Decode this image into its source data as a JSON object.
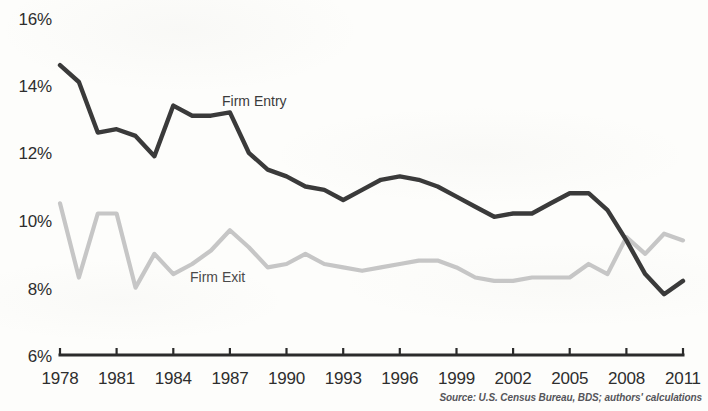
{
  "chart_data": {
    "type": "line",
    "title": "",
    "subtitle": "",
    "xlabel": "",
    "ylabel": "",
    "xlim": [
      1978,
      2011
    ],
    "ylim": [
      6,
      16
    ],
    "y_tick_labels": [
      "16%",
      "14%",
      "12%",
      "10%",
      "8%",
      "6%"
    ],
    "y_tick_values": [
      16,
      14,
      12,
      10,
      8,
      6
    ],
    "x_tick_labels": [
      "1978",
      "1981",
      "1984",
      "1987",
      "1990",
      "1993",
      "1996",
      "1999",
      "2002",
      "2005",
      "2008",
      "2011"
    ],
    "x_tick_values": [
      1978,
      1981,
      1984,
      1987,
      1990,
      1993,
      1996,
      1999,
      2002,
      2005,
      2008,
      2011
    ],
    "grid": false,
    "legend_position": "inline-labels",
    "x": [
      1978,
      1979,
      1980,
      1981,
      1982,
      1983,
      1984,
      1985,
      1986,
      1987,
      1988,
      1989,
      1990,
      1991,
      1992,
      1993,
      1994,
      1995,
      1996,
      1997,
      1998,
      1999,
      2000,
      2001,
      2002,
      2003,
      2004,
      2005,
      2006,
      2007,
      2008,
      2009,
      2010,
      2011
    ],
    "series": [
      {
        "name": "Firm Entry",
        "color": "#3a3a3a",
        "values": [
          14.6,
          14.1,
          12.6,
          12.7,
          12.5,
          11.9,
          13.4,
          13.1,
          13.1,
          13.2,
          12.0,
          11.5,
          11.3,
          11.0,
          10.9,
          10.6,
          10.9,
          11.2,
          11.3,
          11.2,
          11.0,
          10.7,
          10.4,
          10.1,
          10.2,
          10.2,
          10.5,
          10.8,
          10.8,
          10.3,
          9.4,
          8.4,
          7.8,
          8.2
        ]
      },
      {
        "name": "Firm Exit",
        "color": "#c6c6c6",
        "values": [
          10.5,
          8.3,
          10.2,
          10.2,
          8.0,
          9.0,
          8.4,
          8.7,
          9.1,
          9.7,
          9.2,
          8.6,
          8.7,
          9.0,
          8.7,
          8.6,
          8.5,
          8.6,
          8.7,
          8.8,
          8.8,
          8.6,
          8.3,
          8.2,
          8.2,
          8.3,
          8.3,
          8.3,
          8.7,
          8.4,
          9.5,
          9.0,
          9.6,
          9.4
        ]
      }
    ],
    "annotations": [
      {
        "text": "Firm Entry",
        "series": "Firm Entry"
      },
      {
        "text": "Firm Exit",
        "series": "Firm Exit"
      }
    ],
    "source": "Source: U.S. Census Bureau, BDS; authors' calculations"
  },
  "axes": {
    "y_labels": [
      "16%",
      "14%",
      "12%",
      "10%",
      "8%",
      "6%"
    ],
    "x_labels": [
      "1978",
      "1981",
      "1984",
      "1987",
      "1990",
      "1993",
      "1996",
      "1999",
      "2002",
      "2005",
      "2008",
      "2011"
    ]
  },
  "labels": {
    "firm_entry": "Firm Entry",
    "firm_exit": "Firm Exit"
  },
  "footer": {
    "source": "Source: U.S. Census Bureau, BDS; authors' calculations"
  },
  "colors": {
    "entry_line": "#3a3a3a",
    "exit_line": "#c6c6c6",
    "axis": "#2b2b2b",
    "background": "#fdfdfb"
  }
}
